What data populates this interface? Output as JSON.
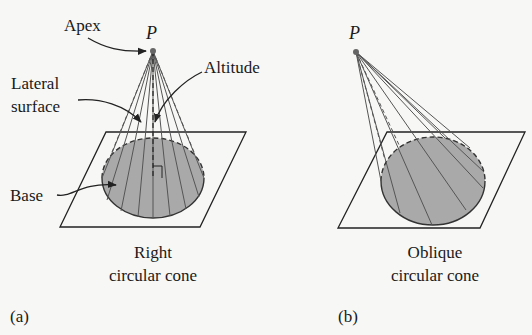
{
  "figure": {
    "panel_a": {
      "tag": "(a)",
      "caption_line1": "Right",
      "caption_line2": "circular cone",
      "apex_label": "P",
      "callouts": {
        "apex": "Apex",
        "lateral_line1": "Lateral",
        "lateral_line2": "surface",
        "altitude": "Altitude",
        "base": "Base"
      }
    },
    "panel_b": {
      "tag": "(b)",
      "caption_line1": "Oblique",
      "caption_line2": "circular cone",
      "apex_label": "P"
    },
    "colors": {
      "base_fill": "#a9a9a9",
      "line": "#222222",
      "ruling": "#555555",
      "background": "#f7f7f5"
    }
  }
}
